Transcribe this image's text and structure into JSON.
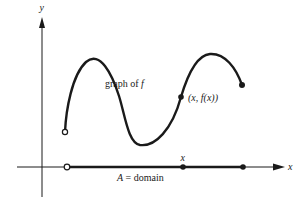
{
  "diagram": {
    "axes": {
      "x_label": "x",
      "y_label": "y"
    },
    "labels": {
      "graph_prefix": "graph of ",
      "graph_fn": "f",
      "point_label": "(x, f(x))",
      "point_x": "x",
      "point_fx": "f(x)",
      "x_marker": "x",
      "domain_var": "A",
      "domain_eq": " = domain"
    },
    "points": {
      "curve_start": {
        "style": "open",
        "x": 65,
        "y": 132
      },
      "curve_point": {
        "style": "filled",
        "x": 181,
        "y": 97
      },
      "curve_end": {
        "style": "filled",
        "x": 242,
        "y": 85
      },
      "domain_start": {
        "style": "open",
        "x": 67,
        "y": 167
      },
      "domain_x": {
        "style": "filled",
        "x": 183,
        "y": 167
      },
      "domain_end": {
        "style": "filled",
        "x": 243,
        "y": 167
      }
    },
    "colors": {
      "ink": "#1a1a1a",
      "background": "#ffffff"
    }
  }
}
